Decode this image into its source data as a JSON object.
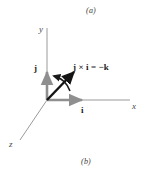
{
  "figure": {
    "panel_label_top": "(a)",
    "panel_label_bottom": "(b)",
    "background_color": "#ffffff",
    "axis_color": "#8c8c8c",
    "vector_color": "#8f8f8f",
    "cross_product_color": "#141414",
    "arc_color": "#1a1a1a",
    "text_color": "#1c1c1c",
    "axes": [
      {
        "name": "y-axis",
        "label": "y",
        "direction": "up"
      },
      {
        "name": "x-axis",
        "label": "x",
        "direction": "right"
      },
      {
        "name": "z-axis",
        "label": "z",
        "direction": "down-left"
      }
    ],
    "unit_vectors": [
      {
        "name": "j",
        "label": "j",
        "direction": "up",
        "color": "#8f8f8f"
      },
      {
        "name": "i",
        "label": "i",
        "direction": "right",
        "color": "#8f8f8f"
      }
    ],
    "cross_product": {
      "label": "j × i = −k",
      "operand_a": "j",
      "operator": "×",
      "operand_b": "i",
      "equals": "=",
      "result": "−k",
      "arrow_direction": "up-right",
      "rotation_arc": "counterclockwise from i toward j"
    }
  }
}
